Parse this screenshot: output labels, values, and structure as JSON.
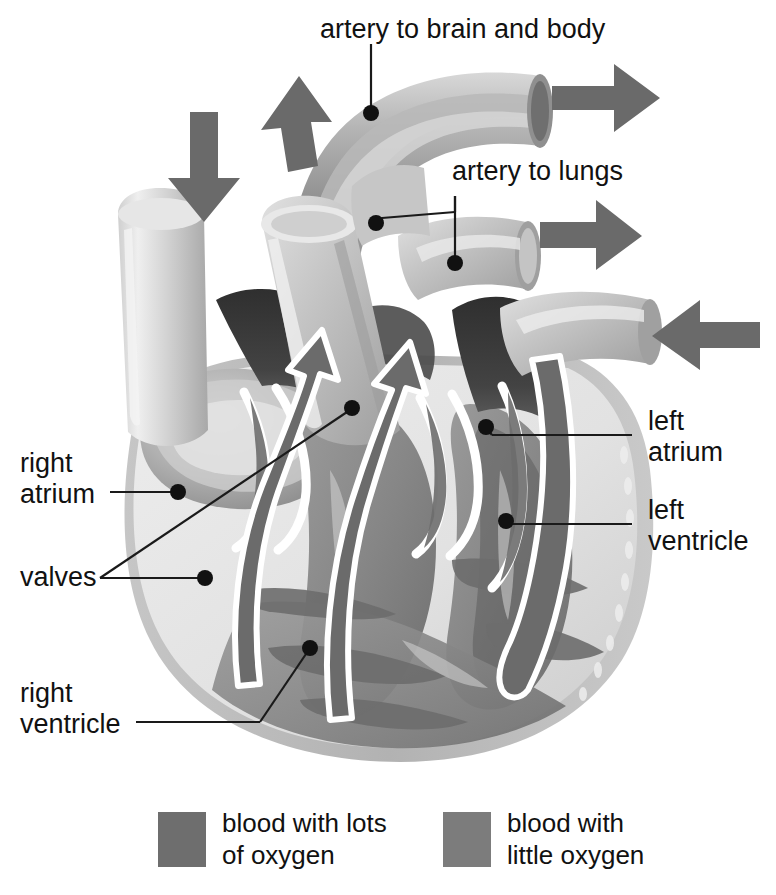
{
  "figure": {
    "background_color": "#ffffff"
  },
  "labels": {
    "artery_to_brain_and_body": "artery to brain and body",
    "artery_to_lungs": "artery to lungs",
    "left_atrium_line1": "left",
    "left_atrium_line2": "atrium",
    "left_ventricle_line1": "left",
    "left_ventricle_line2": "ventricle",
    "right_atrium_line1": "right",
    "right_atrium_line2": "atrium",
    "right_ventricle_line1": "right",
    "right_ventricle_line2": "ventricle",
    "valves": "valves"
  },
  "legend": {
    "items": [
      {
        "label_line1": "blood with lots",
        "label_line2": "of oxygen",
        "swatch_color": "#6e6e6e"
      },
      {
        "label_line1": "blood with",
        "label_line2": "little oxygen",
        "swatch_color": "#7c7c7c"
      }
    ]
  },
  "colors": {
    "oxygenated_blood": "#6e6e6e",
    "deoxygenated_blood": "#7c7c7c",
    "vessel_light": "#c2c2c2",
    "vessel_mid": "#9a9a9a",
    "heart_wall_light": "#e4e4e4",
    "heart_wall_mid": "#b8b8b8",
    "chamber_dark": "#3c3c3c",
    "chamber_shadow": "#5a5a5a",
    "arrow_gray": "#6a6a6a",
    "flow_arrow_fill": "#6b6b6b",
    "flow_arrow_outline": "#ffffff",
    "leader_line": "#1a1a1a",
    "text": "#111111"
  },
  "flow_arrows": {
    "blood_in_top_left": "down-arrow-icon",
    "blood_out_top_left": "up-arrow-icon",
    "blood_out_top_right": "right-arrow-icon",
    "blood_out_mid_right": "right-arrow-icon",
    "blood_in_right": "left-arrow-icon"
  }
}
